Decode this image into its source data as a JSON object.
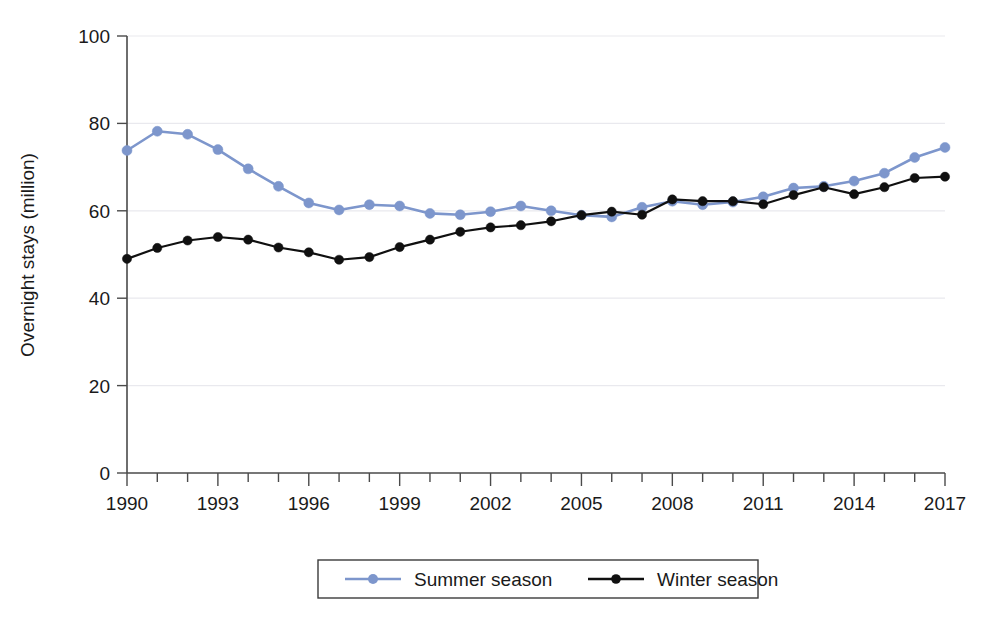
{
  "chart_data": {
    "type": "line",
    "title": "",
    "xlabel": "",
    "ylabel": "Overnight stays (million)",
    "xlim": [
      1990,
      2017
    ],
    "ylim": [
      0,
      100
    ],
    "yticks": [
      0,
      20,
      40,
      60,
      80,
      100
    ],
    "ytick_labels": [
      "0",
      "20",
      "40",
      "60",
      "80",
      "100"
    ],
    "xticks": [
      1990,
      1993,
      1996,
      1999,
      2002,
      2005,
      2008,
      2011,
      2014,
      2017
    ],
    "xtick_labels": [
      "1990",
      "1993",
      "1996",
      "1999",
      "2002",
      "2005",
      "2008",
      "2011",
      "2014",
      "2017"
    ],
    "x_minor_ticks_every": 1,
    "grid": "horizontal",
    "legend_position": "bottom",
    "x": [
      1990,
      1991,
      1992,
      1993,
      1994,
      1995,
      1996,
      1997,
      1998,
      1999,
      2000,
      2001,
      2002,
      2003,
      2004,
      2005,
      2006,
      2007,
      2008,
      2009,
      2010,
      2011,
      2012,
      2013,
      2014,
      2015,
      2016,
      2017
    ],
    "series": [
      {
        "name": "Summer season",
        "color": "#7d96cc",
        "marker": "circle",
        "values": [
          73.8,
          78.2,
          77.5,
          74.0,
          69.6,
          65.6,
          61.8,
          60.2,
          61.4,
          61.1,
          59.4,
          59.1,
          59.8,
          61.1,
          60.0,
          59.0,
          58.6,
          60.8,
          62.2,
          61.4,
          62.0,
          63.2,
          65.2,
          65.6,
          66.8,
          68.6,
          72.2,
          74.5
        ]
      },
      {
        "name": "Winter season",
        "color": "#101010",
        "marker": "circle",
        "values": [
          49.0,
          51.5,
          53.2,
          54.0,
          53.4,
          51.6,
          50.5,
          48.8,
          49.4,
          51.7,
          53.4,
          55.2,
          56.2,
          56.7,
          57.6,
          59.0,
          59.8,
          59.1,
          62.6,
          62.2,
          62.2,
          61.5,
          63.6,
          65.4,
          63.8,
          65.4,
          67.5,
          67.8
        ]
      }
    ]
  },
  "legend": {
    "entries": [
      {
        "label": "Summer season",
        "color": "#7d96cc"
      },
      {
        "label": "Winter season",
        "color": "#101010"
      }
    ]
  }
}
